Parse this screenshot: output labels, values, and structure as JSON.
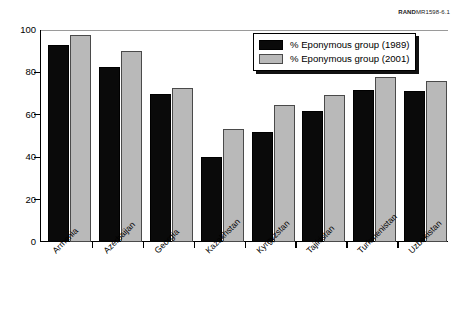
{
  "source_credit": {
    "brand": "RAND",
    "document_id": "MR1598-6.1"
  },
  "legend": {
    "position": "top-right-inside",
    "entries": [
      {
        "label": "% Eponymous group (1989)",
        "color": "#0a0a0a"
      },
      {
        "label": "% Eponymous group (2001)",
        "color": "#b9b9b9"
      }
    ]
  },
  "chart_data": {
    "type": "bar",
    "title": "",
    "subtitle": "",
    "xlabel": "",
    "ylabel": "",
    "ylim": [
      0,
      100
    ],
    "yticks": [
      0,
      20,
      40,
      60,
      80,
      100
    ],
    "ytick_labels": [
      "0",
      "20",
      "40",
      "60",
      "80",
      "100"
    ],
    "grid": false,
    "legend_position": "upper right",
    "categories": [
      "Armenia",
      "Azerbaijan",
      "Georgia",
      "Kazakhstan",
      "Kyrgyzstan",
      "Tajikistan",
      "Turkmenistan",
      "Uzbekistan"
    ],
    "series": [
      {
        "name": "% Eponymous group (1989)",
        "color": "#0a0a0a",
        "values": [
          93,
          82.5,
          70,
          40,
          52,
          62,
          71.5,
          71
        ]
      },
      {
        "name": "% Eponymous group (2001)",
        "color": "#b9b9b9",
        "values": [
          97.5,
          90,
          72.5,
          53.5,
          64.5,
          69.5,
          78,
          76
        ]
      }
    ],
    "annotations": []
  }
}
